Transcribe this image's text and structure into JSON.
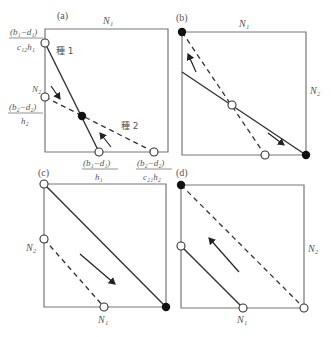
{
  "figure": {
    "panels": [
      {
        "id": "a",
        "tag": "(a)",
        "top_axis_label": "N₁",
        "y_intercept_sp1": {
          "num": "(b₁−d₁)",
          "den": "c₁₂h₁"
        },
        "y_intercept_sp2_label": "N₂",
        "y_intercept_sp2": {
          "num": "(b₂−d₂)",
          "den": "h₂"
        },
        "x_intercept_sp1": {
          "num": "(b₁−d₁)",
          "den": "h₁"
        },
        "x_intercept_sp2": {
          "num": "(b₂−d₂)",
          "den": "c₂₁h₂"
        },
        "species1_label": "種 1",
        "species2_label": "種 2",
        "equilibrium": "stable coexistence (filled point)"
      },
      {
        "id": "b",
        "tag": "(b)",
        "top_axis_label": "N₁",
        "right_axis_label": "N₂",
        "equilibrium": "unstable interior point; two filled corner points"
      },
      {
        "id": "c",
        "tag": "(c)",
        "left_axis_label": "N₂",
        "bottom_axis_label": "N₁",
        "equilibrium": "species 1 wins (filled point bottom-right)"
      },
      {
        "id": "d",
        "tag": "(d)",
        "right_axis_label": "N₂",
        "bottom_axis_label": "N₁",
        "equilibrium": "species 2 wins (filled point top-left)"
      }
    ],
    "colors": {
      "line": "#333333",
      "frame": "#666666",
      "text": "#555555",
      "filled_point": "#111111",
      "open_point": "#ffffff"
    }
  }
}
